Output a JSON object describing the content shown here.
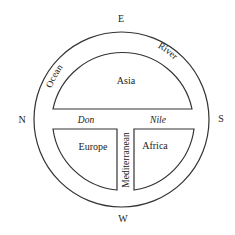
{
  "diagram": {
    "type": "T-O map",
    "compass": {
      "top": "E",
      "left": "N",
      "right": "S",
      "bottom": "W"
    },
    "ocean_ring": {
      "label_left": "Ocean",
      "label_right": "River"
    },
    "continents": {
      "top": "Asia",
      "bottom_left": "Europe",
      "bottom_right": "Africa"
    },
    "waterways": {
      "left_horizontal": "Don",
      "right_horizontal": "Nile",
      "vertical": "Mediterranean"
    },
    "colors": {
      "line": "#333333",
      "text": "#222222",
      "background": "#ffffff"
    }
  }
}
